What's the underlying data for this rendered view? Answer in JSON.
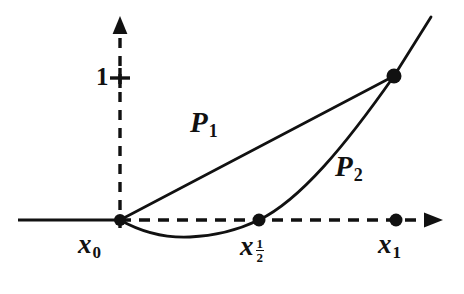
{
  "figure": {
    "background_color": "#ffffff",
    "ink_color": "#111111",
    "width": 464,
    "height": 294
  },
  "axes": {
    "origin": {
      "x": 120,
      "y": 220
    },
    "x_axis": {
      "solid_segment": {
        "x_start": 18,
        "x_end": 120,
        "y": 220
      },
      "dashed_segment": {
        "x_start": 120,
        "x_end": 432,
        "y": 220
      },
      "arrow_tip_x": 442,
      "style_left": "solid",
      "style_right": "dashed"
    },
    "y_axis": {
      "x": 120,
      "y_bottom": 228,
      "y_top": 30,
      "arrow_tip_y": 17,
      "style": "dashed"
    },
    "y_tick": {
      "label": "1",
      "value": 1,
      "y": 78,
      "tick_mark": "plus"
    }
  },
  "points": [
    {
      "id": "x0",
      "label_base": "x",
      "label_sub": "0",
      "cx": 120,
      "cy": 220,
      "r": 6.0,
      "label_x": 78,
      "label_y": 231
    },
    {
      "id": "xhalf",
      "label_base": "x",
      "label_sub": "1/2",
      "cx": 259,
      "cy": 220,
      "r": 6.5,
      "label_x": 240,
      "label_y": 233
    },
    {
      "id": "x1",
      "label_base": "x",
      "label_sub": "1",
      "cx": 396,
      "cy": 220,
      "r": 6.5,
      "label_x": 378,
      "label_y": 231
    },
    {
      "id": "top",
      "label_base": "",
      "label_sub": "",
      "cx": 394,
      "cy": 76,
      "r": 7.5,
      "label_x": 0,
      "label_y": 0
    }
  ],
  "curves": [
    {
      "id": "P1",
      "label_base": "P",
      "label_sub": "1",
      "kind": "linear",
      "description": "straight chord from x0 to the point above x1",
      "path": "M 120 220 L 394 76",
      "label_x": 190,
      "label_y": 108
    },
    {
      "id": "P2",
      "label_base": "P",
      "label_sub": "2",
      "kind": "quadratic",
      "description": "parabola through x0, dipping below axis, rising through x-half up past the point above x1",
      "path": "M 120 220 C 143 233 168 238 190 237 C 216 236 240 229 259 220 C 300 200 345 146 394 76 L 431 17",
      "minimum": {
        "x": 190,
        "y": 237
      },
      "label_x": 335,
      "label_y": 152
    }
  ]
}
